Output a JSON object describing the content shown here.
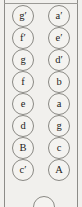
{
  "panel": {
    "title": "string-note-label-column",
    "description": "Two vertical columns of circled note names",
    "background_color": "#f1f0ed",
    "circle_border_color": "#8a8984",
    "text_color": "#1d1d1b"
  },
  "columns": {
    "left": {
      "name": "left-note-column",
      "notes": [
        "g′",
        "f′",
        "g",
        "f",
        "e",
        "d",
        "B",
        "c′"
      ]
    },
    "right": {
      "name": "right-note-column",
      "notes": [
        "a′",
        "e′",
        "d′",
        "b",
        "a",
        "g",
        "c",
        "A"
      ]
    }
  },
  "partial_circle": {
    "name": "partial-note-circle",
    "label": ""
  }
}
